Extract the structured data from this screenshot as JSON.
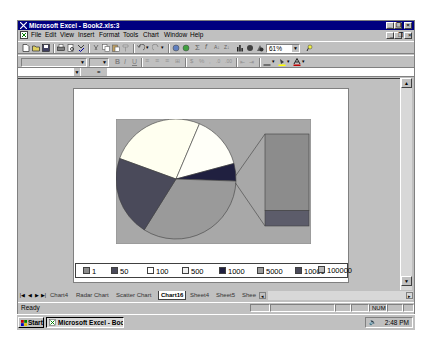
{
  "window": {
    "title": "Microsoft Excel - Book2.xls:3",
    "controls": [
      "minimize",
      "maximize",
      "close"
    ]
  },
  "menu": {
    "items": [
      "File",
      "Edit",
      "View",
      "Insert",
      "Format",
      "Tools",
      "Chart",
      "Window",
      "Help"
    ]
  },
  "toolbar": {
    "zoom_value": "61%",
    "standard_icons": [
      "new-icon",
      "open-icon",
      "save-icon",
      "print-icon",
      "print-preview-icon",
      "spelling-icon",
      "cut-icon",
      "copy-icon",
      "paste-icon",
      "format-painter-icon",
      "undo-icon",
      "redo-icon",
      "hyperlink-icon",
      "web-toolbar-icon",
      "autosum-icon",
      "function-icon",
      "sort-ascending-icon",
      "sort-descending-icon",
      "chart-wizard-icon",
      "map-icon",
      "drawing-icon",
      "help-icon"
    ],
    "formatting_icons": [
      "bold-icon",
      "italic-icon",
      "underline-icon",
      "align-left-icon",
      "center-icon",
      "align-right-icon",
      "merge-center-icon",
      "currency-icon",
      "percent-icon",
      "comma-icon",
      "increase-decimal-icon",
      "decrease-decimal-icon",
      "decrease-indent-icon",
      "increase-indent-icon",
      "borders-icon",
      "fill-color-icon",
      "font-color-icon"
    ]
  },
  "formula_bar": {
    "name_box": "",
    "equals": "=",
    "content": ""
  },
  "chart_data": {
    "type": "pie",
    "subtype": "bar-of-pie",
    "title": "",
    "legend_position": "bottom",
    "categories": [
      "1",
      "50",
      "100",
      "500",
      "1000",
      "5000",
      "10000",
      "100000"
    ],
    "pie_slices": [
      {
        "label": "100",
        "color": "#fffff0",
        "start_deg": -160,
        "end_deg": -67
      },
      {
        "label": "500",
        "color": "#fffff8",
        "start_deg": -67,
        "end_deg": -15
      },
      {
        "label": "1000",
        "color": "#202040",
        "start_deg": -15,
        "end_deg": 2
      },
      {
        "label": "5000",
        "color": "#9a9a9a",
        "start_deg": 2,
        "end_deg": 122
      },
      {
        "label": "10000",
        "color": "#4a4a5a",
        "start_deg": 122,
        "end_deg": 200
      }
    ],
    "secondary_bar": [
      {
        "label": "1",
        "color": "#8c8c8c",
        "share": 0.83
      },
      {
        "label": "50",
        "color": "#5c5c6a",
        "share": 0.17
      }
    ],
    "legend": [
      {
        "label": "1",
        "color": "#8c8c8c"
      },
      {
        "label": "50",
        "color": "#4a4a5a"
      },
      {
        "label": "100",
        "color": "#ffffff"
      },
      {
        "label": "500",
        "color": "#f0f0f0"
      },
      {
        "label": "1000",
        "color": "#202040"
      },
      {
        "label": "5000",
        "color": "#9a9a9a"
      },
      {
        "label": "10000",
        "color": "#4a4a5a"
      },
      {
        "label": "100000",
        "color": "#b8b8b8"
      }
    ],
    "plot_background": "#a8a8a8"
  },
  "sheet_tabs": {
    "tabs": [
      "Chart4",
      "Radar Chart",
      "Scatter Chart",
      "Chart16",
      "Sheet4",
      "Sheet5",
      "Shee"
    ],
    "active": "Chart16"
  },
  "status_bar": {
    "text": "Ready",
    "indicators": [
      "NUM"
    ]
  },
  "taskbar": {
    "start_label": "Start",
    "task_label": "Microsoft Excel - Boo...",
    "clock": "2:48 PM"
  }
}
